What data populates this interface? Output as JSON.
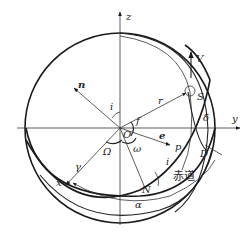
{
  "diagram": {
    "title": "",
    "type": "orbital-elements-celestial-sphere",
    "colors": {
      "stroke": "#1a1a1a",
      "background": "#ffffff"
    },
    "labels": {
      "z_axis": "z",
      "y_axis": "y",
      "x_axis": "x",
      "normal_vector": "n",
      "inclination_top": "i",
      "radius": "r",
      "satellite": "S",
      "velocity": "V",
      "declination": "δ",
      "origin": "O",
      "true_anomaly": "f",
      "eccentricity_vector": "e",
      "perigee": "p",
      "raan": "Ω",
      "arg_perigee": "ω",
      "vernal_equinox": "γ",
      "inclination_node": "i",
      "ascending_node": "N",
      "equator": "赤道",
      "subpoint": "D",
      "right_ascension": "α"
    }
  }
}
